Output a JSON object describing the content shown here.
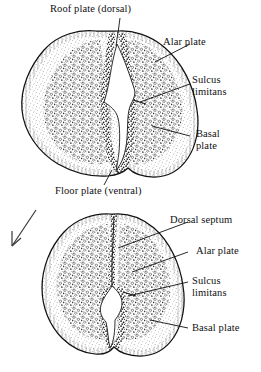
{
  "figure": {
    "background_color": "#ffffff",
    "ink_color": "#1a1a1a"
  },
  "panels": [
    {
      "id": "upper-panel",
      "name": "early-spinal-cord-cross-section",
      "labels": [
        {
          "id": "roof-plate",
          "text": "Roof plate (dorsal)",
          "lines": 1
        },
        {
          "id": "alar-plate",
          "text": "Alar plate",
          "lines": 1
        },
        {
          "id": "sulcus-limitans",
          "text": "Sulcus\nlimitans",
          "lines": 2
        },
        {
          "id": "basal-plate",
          "text": "Basal\nplate",
          "lines": 2
        },
        {
          "id": "floor-plate",
          "text": "Floor plate (ventral)",
          "lines": 1
        }
      ]
    },
    {
      "id": "lower-panel",
      "name": "later-spinal-cord-cross-section",
      "labels": [
        {
          "id": "dorsal-septum",
          "text": "Dorsal septum",
          "lines": 1
        },
        {
          "id": "alar-plate-2",
          "text": "Alar plate",
          "lines": 1
        },
        {
          "id": "sulcus-limitans-2",
          "text": "Sulcus\nlimitans",
          "lines": 2
        },
        {
          "id": "basal-plate-2",
          "text": "Basal plate",
          "lines": 1
        }
      ]
    }
  ],
  "annotations": {
    "hand_arrow": "hand-drawn-arrow-pointing-down-left"
  }
}
